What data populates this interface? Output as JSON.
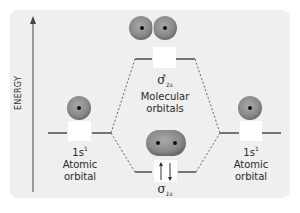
{
  "diagram": {
    "axis": {
      "label": "ENERGY"
    },
    "left_atomic": {
      "config": "1s",
      "config_sup": "1",
      "line1": "Atomic",
      "line2": "orbital"
    },
    "right_atomic": {
      "config": "1s",
      "config_sup": "1",
      "line1": "Atomic",
      "line2": "orbital"
    },
    "antibonding": {
      "symbol": "σ",
      "sub": "1s",
      "star": "*",
      "line1": "Molecular",
      "line2": "orbitals"
    },
    "bonding": {
      "symbol": "σ",
      "sub": "1s",
      "electrons": "↑↓"
    },
    "colors": {
      "background": "#efefef",
      "orbital_fill": "#8a8a8a",
      "orbital_edge": "#5f5f5f",
      "nucleus": "#111111",
      "line": "#333333"
    }
  }
}
